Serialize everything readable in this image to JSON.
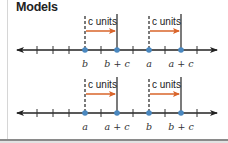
{
  "title": "Models",
  "colors": {
    "axis": "#222222",
    "point": "#4a88c0",
    "arrow": "#d9642a"
  },
  "number_lines": [
    {
      "shift_label": "c units",
      "point_labels": [
        "b",
        "b + c",
        "a",
        "a + c"
      ],
      "label_parts": [
        {
          "var": "b",
          "plus": "",
          "c": ""
        },
        {
          "var": "b",
          "plus": "+",
          "c": "c"
        },
        {
          "var": "a",
          "plus": "",
          "c": ""
        },
        {
          "var": "a",
          "plus": "+",
          "c": "c"
        }
      ]
    },
    {
      "shift_label": "c units",
      "point_labels": [
        "a",
        "a + c",
        "b",
        "b + c"
      ],
      "label_parts": [
        {
          "var": "a",
          "plus": "",
          "c": ""
        },
        {
          "var": "a",
          "plus": "+",
          "c": "c"
        },
        {
          "var": "b",
          "plus": "",
          "c": ""
        },
        {
          "var": "b",
          "plus": "+",
          "c": "c"
        }
      ]
    }
  ],
  "shift_labels": {
    "top_left": "c units",
    "top_right": "c units",
    "bottom_left": "c units",
    "bottom_right": "c units"
  },
  "labels": {
    "line1": {
      "p1": "b",
      "p2": "b + c",
      "p3": "a",
      "p4": "a + c"
    },
    "line2": {
      "p1": "a",
      "p2": "a + c",
      "p3": "b",
      "p4": "b + c"
    }
  }
}
